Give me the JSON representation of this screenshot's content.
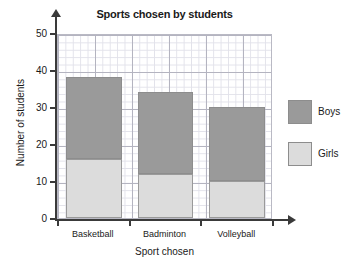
{
  "chart_data": {
    "type": "bar",
    "subtype": "stacked-bar",
    "title": "Sports chosen by students",
    "xlabel": "Sport chosen",
    "ylabel": "Number of students",
    "categories": [
      "Basketball",
      "Badminton",
      "Volleyball"
    ],
    "series": [
      {
        "name": "Girls",
        "values": [
          16,
          12,
          10
        ],
        "color": "#dcdcdc"
      },
      {
        "name": "Boys",
        "values": [
          22,
          22,
          20
        ],
        "color": "#9a9a9a"
      }
    ],
    "totals": [
      38,
      34,
      30
    ],
    "ylim": [
      0,
      50
    ],
    "ytick_labels": [
      "0",
      "10",
      "20",
      "30",
      "40",
      "50"
    ],
    "ytick_values": [
      0,
      10,
      20,
      30,
      40,
      50
    ],
    "y_major_step": 10,
    "y_minor_step": 2,
    "grid": true,
    "legend_position": "right",
    "legend": [
      {
        "label": "Boys",
        "color": "#9a9a9a"
      },
      {
        "label": "Girls",
        "color": "#dcdcdc"
      }
    ]
  }
}
